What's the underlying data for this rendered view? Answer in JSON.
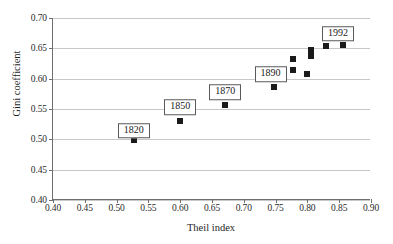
{
  "chart_data": {
    "type": "scatter",
    "title": "",
    "xlabel": "Theil index",
    "ylabel": "Gini coefficient",
    "xlim": [
      0.4,
      0.9
    ],
    "ylim": [
      0.4,
      0.7
    ],
    "xticks": [
      "0.40",
      "0.45",
      "0.50",
      "0.55",
      "0.60",
      "0.65",
      "0.70",
      "0.75",
      "0.80",
      "0.85",
      "0.90"
    ],
    "xtick_values": [
      0.4,
      0.45,
      0.5,
      0.55,
      0.6,
      0.65,
      0.7,
      0.75,
      0.8,
      0.85,
      0.9
    ],
    "yticks": [
      "0.40",
      "0.45",
      "0.50",
      "0.55",
      "0.60",
      "0.65",
      "0.70"
    ],
    "ytick_values": [
      0.4,
      0.45,
      0.5,
      0.55,
      0.6,
      0.65,
      0.7
    ],
    "grid": "horizontal",
    "legend": "none",
    "marker_color": "#1a1a1a",
    "gridline_color": "#c8c8c8",
    "axis_color": "#6e6e6e",
    "points": [
      {
        "x": 0.527,
        "y": 0.499,
        "label": "1820"
      },
      {
        "x": 0.6,
        "y": 0.53,
        "label": "1850"
      },
      {
        "x": 0.671,
        "y": 0.556,
        "label": "1870"
      },
      {
        "x": 0.748,
        "y": 0.586,
        "label": "1890"
      },
      {
        "x": 0.777,
        "y": 0.614,
        "label": ""
      },
      {
        "x": 0.777,
        "y": 0.633,
        "label": ""
      },
      {
        "x": 0.799,
        "y": 0.608,
        "label": ""
      },
      {
        "x": 0.806,
        "y": 0.638,
        "label": ""
      },
      {
        "x": 0.806,
        "y": 0.648,
        "label": ""
      },
      {
        "x": 0.829,
        "y": 0.654,
        "label": ""
      },
      {
        "x": 0.856,
        "y": 0.655,
        "label": "1992"
      }
    ],
    "annotations": [
      {
        "text": "1820",
        "x": 0.527,
        "y": 0.514
      },
      {
        "text": "1850",
        "x": 0.6,
        "y": 0.553
      },
      {
        "text": "1870",
        "x": 0.671,
        "y": 0.578
      },
      {
        "text": "1890",
        "x": 0.742,
        "y": 0.607
      },
      {
        "text": "1992",
        "x": 0.848,
        "y": 0.674
      }
    ]
  }
}
